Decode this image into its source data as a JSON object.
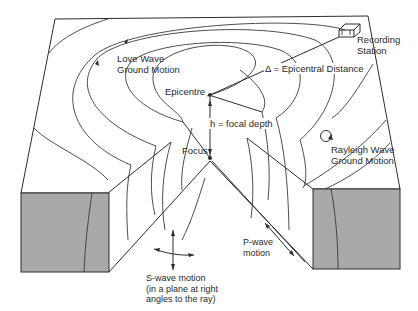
{
  "diagram": {
    "type": "seismic-wave-block-diagram",
    "labels": {
      "love_wave": [
        "Love Wave",
        "Ground Motion"
      ],
      "epicentre": "Epicentre",
      "epicentral_distance": "Δ = Epicentral Distance",
      "recording_station": [
        "Recording",
        "Station"
      ],
      "focal_depth": "h = focal depth",
      "focus": "Focus",
      "rayleigh_wave": [
        "Rayleigh Wave",
        "Ground Motion"
      ],
      "p_wave": [
        "P-wave",
        "motion"
      ],
      "s_wave": [
        "S-wave motion",
        "(in a plane at right",
        "angles to the ray)"
      ]
    },
    "colors": {
      "line": "#2d2d2d",
      "block_fill": "#a9a9a9",
      "background": "#ffffff"
    }
  }
}
